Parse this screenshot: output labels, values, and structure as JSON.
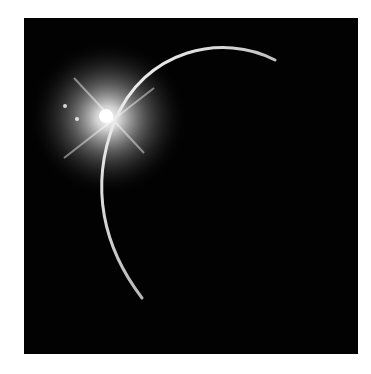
{
  "image": {
    "subject": "solar eclipse diamond ring over dark planet",
    "background_color": "#ffffff",
    "frame_color": "#020202",
    "glow_color": "#ffffff",
    "arc_color": "#f4f4f4"
  }
}
